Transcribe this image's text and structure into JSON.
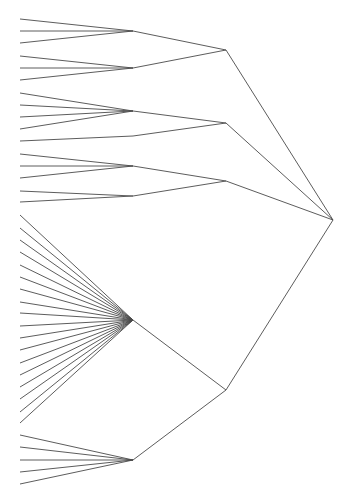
{
  "diagram": {
    "type": "dendrogram",
    "orientation": "right-to-left (root on right, leaves on left)",
    "edge_color": "#4a4a4a",
    "background": "#ffffff",
    "tree": {
      "name": "root",
      "children": [
        {
          "name": "group-a",
          "children": [
            {
              "name": "cluster-a1",
              "leaves": 3
            },
            {
              "name": "cluster-a2",
              "leaves": 3
            }
          ]
        },
        {
          "name": "group-b",
          "children": [
            {
              "name": "cluster-b1",
              "leaves": 4
            },
            {
              "name": "cluster-b2",
              "leaves": 1
            }
          ]
        },
        {
          "name": "group-c",
          "children": [
            {
              "name": "cluster-c1",
              "leaves": 3
            },
            {
              "name": "cluster-c2",
              "leaves": 2
            }
          ]
        },
        {
          "name": "group-d",
          "children": [
            {
              "name": "cluster-d1",
              "leaves": 18
            },
            {
              "name": "cluster-d2",
              "leaves": 5
            }
          ]
        }
      ]
    }
  }
}
